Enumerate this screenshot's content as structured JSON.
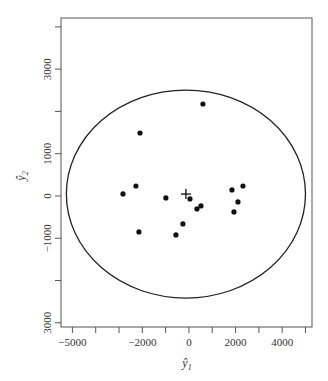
{
  "chart_data": {
    "type": "scatter",
    "title": "",
    "xlabel": "ŷ1",
    "ylabel": "ŷ2",
    "xlim": [
      -5490,
      5280
    ],
    "ylim": [
      -3100,
      4210
    ],
    "grid": false,
    "legend": null,
    "x_ticks": [
      -5000,
      -4000,
      -3000,
      -2000,
      -1000,
      0,
      1000,
      2000,
      3000,
      4000,
      5000
    ],
    "x_tick_labels": [
      {
        "value": -5000,
        "label": "−5000"
      },
      {
        "value": -2000,
        "label": "−2000"
      },
      {
        "value": 0,
        "label": "0"
      },
      {
        "value": 2000,
        "label": "2000"
      },
      {
        "value": 4000,
        "label": "4000"
      }
    ],
    "y_ticks": [
      -3000,
      -2000,
      -1000,
      0,
      1000,
      2000,
      3000,
      4000
    ],
    "y_tick_labels": [
      {
        "value": 3000,
        "label": "3000"
      },
      {
        "value": 1000,
        "label": "1000"
      },
      {
        "value": 0,
        "label": "0"
      },
      {
        "value": -1000,
        "label": "−1000"
      },
      {
        "value": -3000,
        "label": "3000"
      }
    ],
    "series": [
      {
        "name": "observations",
        "marker": "filled-circle",
        "points": [
          {
            "x": 600,
            "y": 2175
          },
          {
            "x": -2100,
            "y": 1490
          },
          {
            "x": -2275,
            "y": 236
          },
          {
            "x": -2830,
            "y": 47
          },
          {
            "x": -990,
            "y": -47
          },
          {
            "x": 43,
            "y": -71
          },
          {
            "x": 343,
            "y": -307
          },
          {
            "x": 515,
            "y": -236
          },
          {
            "x": -258,
            "y": -662
          },
          {
            "x": -558,
            "y": -922
          },
          {
            "x": -2146,
            "y": -851
          },
          {
            "x": 1845,
            "y": 142
          },
          {
            "x": 2318,
            "y": 236
          },
          {
            "x": 2103,
            "y": -142
          },
          {
            "x": 1931,
            "y": -378
          }
        ]
      }
    ],
    "annotations": [
      {
        "type": "plus-marker",
        "label": "mean",
        "x": -130,
        "y": 45
      },
      {
        "type": "ellipse",
        "label": "confidence ellipse",
        "cx": -130,
        "cy": 45,
        "rx": 5130,
        "ry": 2460
      }
    ]
  }
}
